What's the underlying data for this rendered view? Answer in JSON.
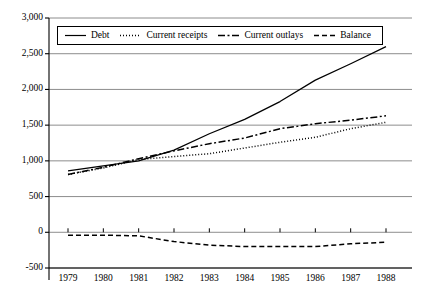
{
  "chart_data": {
    "type": "line",
    "title": "",
    "xlabel": "",
    "ylabel": "",
    "categories": [
      "1979",
      "1980",
      "1981",
      "1982",
      "1983",
      "1984",
      "1985",
      "1986",
      "1987",
      "1988"
    ],
    "x": [
      1979,
      1980,
      1981,
      1982,
      1983,
      1984,
      1985,
      1986,
      1987,
      1988
    ],
    "ylim": [
      -500,
      3000
    ],
    "yticks": [
      -500,
      0,
      500,
      1000,
      1500,
      2000,
      2500,
      3000
    ],
    "ytick_labels": [
      "-500",
      "0",
      "500",
      "1,000",
      "1,500",
      "2,000",
      "2,500",
      "3,000"
    ],
    "grid": "horizontal",
    "legend_position": "top-left-inside",
    "series": [
      {
        "name": "Debt",
        "style": "solid",
        "color": "#000000",
        "values": [
          860,
          930,
          1000,
          1150,
          1380,
          1580,
          1830,
          2130,
          2360,
          2600
        ]
      },
      {
        "name": "Current receipts",
        "style": "dotted",
        "color": "#000000",
        "values": [
          810,
          900,
          1020,
          1060,
          1100,
          1180,
          1260,
          1330,
          1450,
          1540
        ]
      },
      {
        "name": "Current outlays",
        "style": "dash-dot",
        "color": "#000000",
        "values": [
          810,
          910,
          1030,
          1140,
          1240,
          1320,
          1450,
          1520,
          1570,
          1630
        ]
      },
      {
        "name": "Balance",
        "style": "dashed",
        "color": "#000000",
        "values": [
          -40,
          -40,
          -50,
          -130,
          -180,
          -200,
          -200,
          -200,
          -160,
          -140
        ]
      }
    ]
  },
  "legend": {
    "items": [
      {
        "label": "Debt",
        "style": "solid"
      },
      {
        "label": "Current receipts",
        "style": "dotted"
      },
      {
        "label": "Current outlays",
        "style": "dash-dot"
      },
      {
        "label": "Balance",
        "style": "dashed"
      }
    ]
  },
  "axes": {
    "y_tick_labels": [
      "3,000",
      "2,500",
      "2,000",
      "1,500",
      "1,000",
      "500",
      "0",
      "-500"
    ],
    "x_tick_labels": [
      "1979",
      "1980",
      "1981",
      "1982",
      "1983",
      "1984",
      "1985",
      "1986",
      "1987",
      "1988"
    ]
  },
  "colors": {
    "line": "#000000",
    "grid": "#808080",
    "axis": "#000000",
    "background": "#ffffff"
  }
}
